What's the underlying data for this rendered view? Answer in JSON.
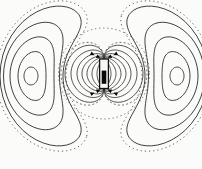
{
  "figure": {
    "canvas": {
      "width": 202,
      "height": 169
    },
    "colors": {
      "background": "#fbfbfa",
      "line": "#2b2b2b",
      "dotted": "#4f4f4f",
      "magnet_stroke": "#111111",
      "magnet_fill": "#f6f6f4",
      "magnet_core": "#0a0a0a",
      "arrow": "#0a0a0a"
    },
    "dipole": {
      "cx": 104,
      "cy": 73.75,
      "pole_half_gap": 15.25
    },
    "magnet": {
      "x": 99.6,
      "y": 59,
      "width": 8.8,
      "height": 29.5,
      "stroke_width": 1.3,
      "core": {
        "x": 101.7,
        "y": 70.6,
        "width": 4.6,
        "height": 13.2
      }
    },
    "boundary_circle": {
      "cx": 104,
      "cy": 73.5,
      "r": 45.5,
      "dash": "1.3,2.8",
      "stroke_width": 0.8
    },
    "field_lobes": {
      "stroke_width": 0.8,
      "samples": 48,
      "loops": [
        {
          "w": 7,
          "e": 0.5
        },
        {
          "w": 12,
          "e": 1.5
        },
        {
          "w": 17,
          "e": 3
        },
        {
          "w": 22,
          "e": 5
        },
        {
          "w": 27,
          "e": 8
        },
        {
          "w": 33,
          "e": 12
        },
        {
          "w": 39,
          "e": 17
        },
        {
          "w": 43,
          "e": 20,
          "dotted": true
        }
      ]
    },
    "return_contours": {
      "cx": 104,
      "cy": 76,
      "stroke_width": 0.9,
      "systems_deg": [
        180,
        0
      ],
      "samples": 72,
      "loops": [
        {
          "span": 7,
          "mid": 73,
          "a": 7,
          "p": 0
        },
        {
          "span": 20,
          "mid": 72,
          "a": 14,
          "p": 2
        },
        {
          "span": 33,
          "mid": 72,
          "a": 22,
          "p": 4
        },
        {
          "span": 47,
          "mid": 72.5,
          "a": 28,
          "p": 6
        },
        {
          "span": 68,
          "mid": 72.5,
          "a": 31.5,
          "p": 9
        },
        {
          "span": 74,
          "mid": 73,
          "a": 35,
          "p": 10,
          "dotted": true
        }
      ]
    },
    "arrowheads": {
      "size": 4.2,
      "items": [
        {
          "x": 100.5,
          "y": 57.8,
          "rot": 22
        },
        {
          "x": 94.5,
          "y": 55.2,
          "rot": 28
        },
        {
          "x": 107.5,
          "y": 57.8,
          "rot": 158
        },
        {
          "x": 113.5,
          "y": 55.2,
          "rot": 152
        },
        {
          "x": 100.5,
          "y": 89.8,
          "rot": -22
        },
        {
          "x": 94.5,
          "y": 92.4,
          "rot": -28
        },
        {
          "x": 107.5,
          "y": 89.8,
          "rot": 202
        },
        {
          "x": 113.5,
          "y": 92.4,
          "rot": 208
        }
      ]
    },
    "dotted_dash": "1.2,3"
  }
}
